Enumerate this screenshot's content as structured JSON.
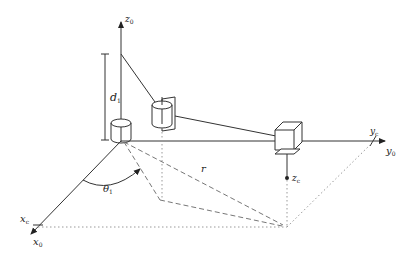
{
  "diagram": {
    "type": "robot-coordinate-frame",
    "labels": {
      "z0": "z",
      "z0_sub": "0",
      "y0": "y",
      "y0_sub": "0",
      "yc": "y",
      "yc_sub": "c",
      "x0": "x",
      "x0_sub": "0",
      "xc": "x",
      "xc_sub": "c",
      "zc": "z",
      "zc_sub": "c",
      "d1": "d",
      "d1_sub": "1",
      "theta1": "θ",
      "theta1_sub": "1",
      "r": "r"
    },
    "colors": {
      "stroke": "#333333",
      "dashed": "#777777",
      "dotted": "#999999"
    }
  }
}
